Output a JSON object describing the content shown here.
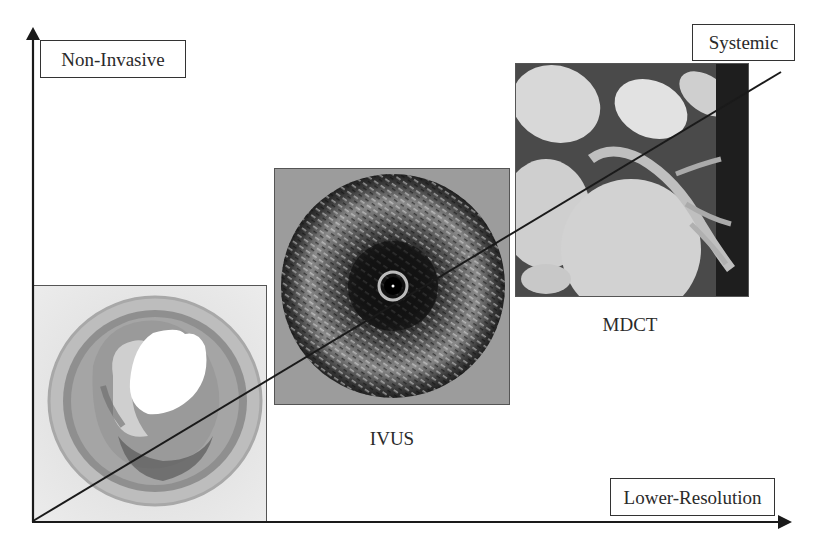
{
  "diagram": {
    "axes": {
      "y_axis_label": "Non-Invasive",
      "x_axis_label": "Lower-Resolution",
      "diagonal_end_label": "Systemic"
    },
    "panels": [
      {
        "id": "histology",
        "caption": "",
        "description": "histology cross-section of coronary artery"
      },
      {
        "id": "ivus",
        "caption": "IVUS",
        "description": "intravascular ultrasound cross-section"
      },
      {
        "id": "mdct",
        "caption": "MDCT",
        "description": "multidetector CT coronary image"
      }
    ],
    "colors": {
      "line": "#1a1a1a",
      "histology_bg": "#e6e6e6",
      "ivus_bg": "#9a9a9a",
      "mdct_bg": "#3a3a3a"
    }
  }
}
